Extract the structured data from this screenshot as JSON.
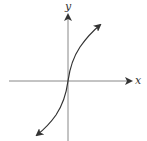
{
  "diagram": {
    "type": "function-graph",
    "axes": {
      "x_label": "x",
      "y_label": "y"
    },
    "colors": {
      "axis": "#555555",
      "curve": "#333333",
      "background": "#ffffff"
    }
  }
}
